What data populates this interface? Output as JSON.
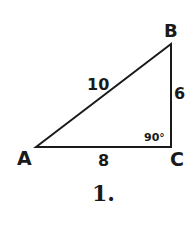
{
  "figure": {
    "caption": "1.",
    "vertices": {
      "A": {
        "label": "A"
      },
      "B": {
        "label": "B"
      },
      "C": {
        "label": "C"
      }
    },
    "sides": {
      "AB": {
        "label": "10"
      },
      "BC": {
        "label": "6"
      },
      "AC": {
        "label": "8"
      }
    },
    "angle_C": {
      "label": "90°"
    },
    "stroke_color": "#1a1a1a"
  }
}
